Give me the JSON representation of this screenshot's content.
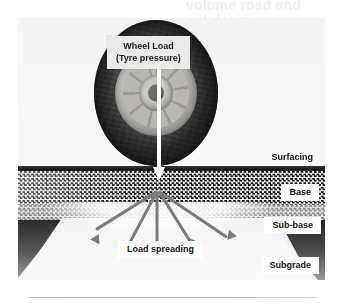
{
  "ghost_heading": {
    "line1": "volume road and",
    "line2": "ent design"
  },
  "diagram": {
    "callout": {
      "line1": "Wheel Load",
      "line2": "(Tyre pressure)"
    },
    "load_spreading_label": "Load spreading",
    "layers": [
      {
        "key": "surfacing",
        "label": "Surfacing"
      },
      {
        "key": "base",
        "label": "Base"
      },
      {
        "key": "subbase",
        "label": "Sub-base"
      },
      {
        "key": "subgrade",
        "label": "Subgrade"
      }
    ],
    "colors": {
      "callout_bg": "#e9e9e9",
      "arrow_white": "#ffffff",
      "spread_arrow": "#7b7b7b",
      "surfacing": "#161616",
      "base_dark": "#111111",
      "base_light": "#f2f2f2",
      "subbase_dark": "#8b8b8b",
      "subbase_light": "#e4e4e4",
      "subgrade": "#f2f2f2",
      "label_bg": "#ffffff",
      "page_bg": "#ffffff",
      "rule": "#c9c9c9"
    }
  }
}
